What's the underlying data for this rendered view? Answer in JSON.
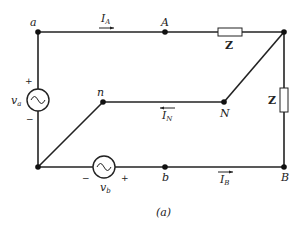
{
  "diagram": {
    "caption": "(a)",
    "nodes": {
      "a": "a",
      "A": "A",
      "n": "n",
      "N": "N",
      "b": "b",
      "B": "B"
    },
    "currents": {
      "IA": {
        "main": "I",
        "sub": "A"
      },
      "IN": {
        "main": "I",
        "sub": "N"
      },
      "IB": {
        "main": "I",
        "sub": "B"
      }
    },
    "sources": {
      "va": {
        "main": "v",
        "sub": "a",
        "plus": "+",
        "minus": "−"
      },
      "vb": {
        "main": "v",
        "sub": "b",
        "plus": "+",
        "minus": "−"
      }
    },
    "impedances": {
      "top": "Z",
      "right": "Z"
    }
  }
}
